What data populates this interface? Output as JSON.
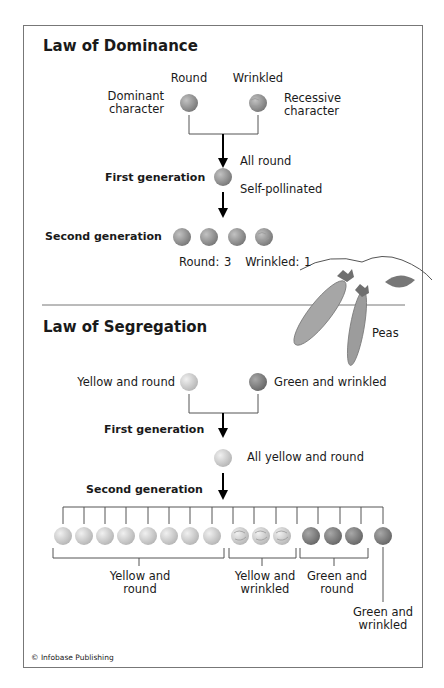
{
  "header_fragment": "...p and Sing...",
  "dominance": {
    "title": "Law of Dominance",
    "parent_labels": {
      "round": "Round",
      "wrinkled": "Wrinkled"
    },
    "dominant_label": [
      "Dominant",
      "character"
    ],
    "recessive_label": [
      "Recessive",
      "character"
    ],
    "first_generation_label": "First generation",
    "all_round": "All round",
    "self_pollinated": "Self-pollinated",
    "second_generation_label": "Second generation",
    "ratio_text": "Round: 3   Wrinkled: 1",
    "second_gen_peas": [
      "round",
      "round",
      "round",
      "wrinkled"
    ]
  },
  "peas_illustration_label": "Peas",
  "segregation": {
    "title": "Law of Segregation",
    "parent_left": "Yellow and round",
    "parent_right": "Green and wrinkled",
    "first_generation_label": "First generation",
    "first_generation_result": "All yellow and round",
    "second_generation_label": "Second generation",
    "groups": [
      {
        "label": [
          "Yellow and",
          "round"
        ],
        "count": 9,
        "color": "yellow",
        "shape": "round"
      },
      {
        "label": [
          "Yellow and",
          "wrinkled"
        ],
        "count": 3,
        "color": "yellow",
        "shape": "wrinkled"
      },
      {
        "label": [
          "Green and",
          "round"
        ],
        "count": 3,
        "color": "green",
        "shape": "round"
      },
      {
        "label": [
          "Green and",
          "wrinkled"
        ],
        "count": 1,
        "color": "green",
        "shape": "wrinkled"
      }
    ]
  },
  "credit": "© Infobase Publishing",
  "colors": {
    "dominance_pea": "#8a8a8a",
    "yellow_pea": "#cfcfcf",
    "green_pea": "#7d7d7d",
    "line": "#555555",
    "arrow": "#000000",
    "pod": "#a0a0a0"
  }
}
